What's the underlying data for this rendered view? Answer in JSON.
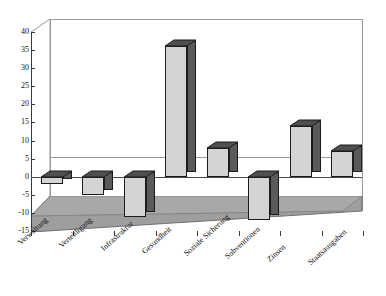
{
  "chart_data": {
    "type": "bar",
    "title": "",
    "subtitle": "",
    "xlabel": "",
    "ylabel": "",
    "ylim": [
      -15,
      40
    ],
    "ytick_step": 5,
    "yticks": [
      40,
      35,
      30,
      25,
      20,
      15,
      10,
      5,
      0,
      -5,
      -10,
      -15
    ],
    "ytick_labels": [
      "40",
      "35",
      "30",
      "25",
      "20",
      "15",
      "10",
      "5",
      "0",
      "-5",
      "-10",
      "-15"
    ],
    "grid": false,
    "legend": "none",
    "three_d": true,
    "bar_color": "#d4d4d4",
    "bar_side_color": "#5a5a5a",
    "bar_edge_color": "#1c1c1c",
    "floor_color": "#9e9e9e",
    "axis_color": "#3a3a3a",
    "categories": [
      "Verwaltung",
      "Verteidigung",
      "Infrastruktur",
      "Gesundheit",
      "Soziale Sicherung",
      "Subventionen",
      "Zinsen",
      "Staatsausgaben"
    ],
    "values": [
      -2,
      -5,
      -11,
      36,
      8,
      -12,
      14,
      7
    ]
  }
}
